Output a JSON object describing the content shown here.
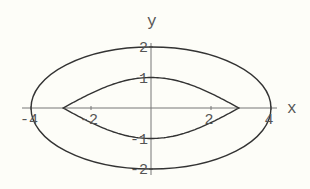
{
  "chart_data": {
    "type": "line",
    "title": "",
    "xlabel": "x",
    "ylabel": "y",
    "xlim": [
      -4.3,
      4.3
    ],
    "ylim": [
      -2.1,
      2.1
    ],
    "grid": false,
    "legend": null,
    "x_ticks": [
      -4,
      -2,
      2,
      4
    ],
    "x_tick_labels": [
      "-4",
      "-2",
      "2",
      "4"
    ],
    "y_ticks": [
      -2,
      -1,
      1,
      2
    ],
    "y_tick_labels": [
      "-2",
      "-1",
      "1",
      "2"
    ],
    "series": [
      {
        "name": "outer ellipse",
        "kind": "ellipse",
        "center": [
          0,
          0
        ],
        "semi_axis_x": 4,
        "semi_axis_y": 2,
        "equation": "x^2/16 + y^2/4 = 1"
      },
      {
        "name": "inner lens",
        "kind": "lens",
        "x_range": [
          -2.93,
          2.93
        ],
        "peak_y": 1,
        "trough_y": -1,
        "equation": "y = ±cos(pi x / 6) approx"
      }
    ]
  },
  "colors": {
    "background": "#fdfdf8",
    "curve": "#333333",
    "axis": "#777777",
    "label": "#555555"
  }
}
